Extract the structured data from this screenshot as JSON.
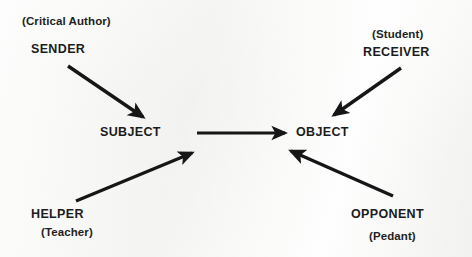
{
  "diagram": {
    "background_color": "#f6f6f4",
    "ink_color": "#161616",
    "nodes": {
      "sender": {
        "role": "SENDER",
        "gloss": "(Critical Author)"
      },
      "receiver": {
        "role": "RECEIVER",
        "gloss": "(Student)"
      },
      "subject": {
        "role": "SUBJECT",
        "gloss": ""
      },
      "object": {
        "role": "OBJECT",
        "gloss": ""
      },
      "helper": {
        "role": "HELPER",
        "gloss": "(Teacher)"
      },
      "opponent": {
        "role": "OPPONENT",
        "gloss": "(Pedant)"
      }
    },
    "arrows": [
      {
        "name": "sender-to-subject",
        "from": "SENDER",
        "to": "SUBJECT",
        "x1": 68,
        "y1": 66,
        "x2": 146,
        "y2": 120,
        "width": 3.4
      },
      {
        "name": "receiver-to-object",
        "from": "RECEIVER",
        "to": "OBJECT",
        "x1": 401,
        "y1": 68,
        "x2": 330,
        "y2": 118,
        "width": 3.4
      },
      {
        "name": "subject-to-object",
        "from": "SUBJECT",
        "to": "OBJECT",
        "x1": 197,
        "y1": 133,
        "x2": 290,
        "y2": 133,
        "width": 3.2
      },
      {
        "name": "helper-to-subject",
        "from": "HELPER",
        "to": "SUBJECT",
        "x1": 76,
        "y1": 201,
        "x2": 196,
        "y2": 151,
        "width": 3.2
      },
      {
        "name": "opponent-to-object",
        "from": "OPPONENT",
        "to": "OBJECT",
        "x1": 393,
        "y1": 196,
        "x2": 287,
        "y2": 149,
        "width": 3.4
      }
    ]
  }
}
